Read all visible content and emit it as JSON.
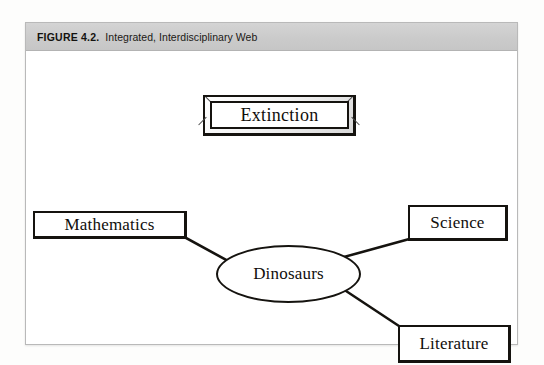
{
  "figure": {
    "label": "FIGURE 4.2.",
    "title": "Integrated, Interdisciplinary Web"
  },
  "diagram": {
    "type": "web-concept-map",
    "center": {
      "id": "dinosaurs",
      "label": "Dinosaurs",
      "shape": "ellipse"
    },
    "nodes": [
      {
        "id": "extinction",
        "label": "Extinction",
        "shape": "beveled-rectangle",
        "connected": false
      },
      {
        "id": "mathematics",
        "label": "Mathematics",
        "shape": "rectangle",
        "connected": true
      },
      {
        "id": "science",
        "label": "Science",
        "shape": "rectangle",
        "connected": true
      },
      {
        "id": "literature",
        "label": "Literature",
        "shape": "rectangle",
        "connected": true
      }
    ],
    "connectors": [
      {
        "from": "mathematics",
        "to": "dinosaurs"
      },
      {
        "from": "dinosaurs",
        "to": "science"
      },
      {
        "from": "dinosaurs",
        "to": "literature"
      }
    ]
  },
  "colors": {
    "caption_bar": "#cfcfcf",
    "ink": "#15130f",
    "paper": "#ffffff",
    "frame_border": "#b9b9b9"
  }
}
